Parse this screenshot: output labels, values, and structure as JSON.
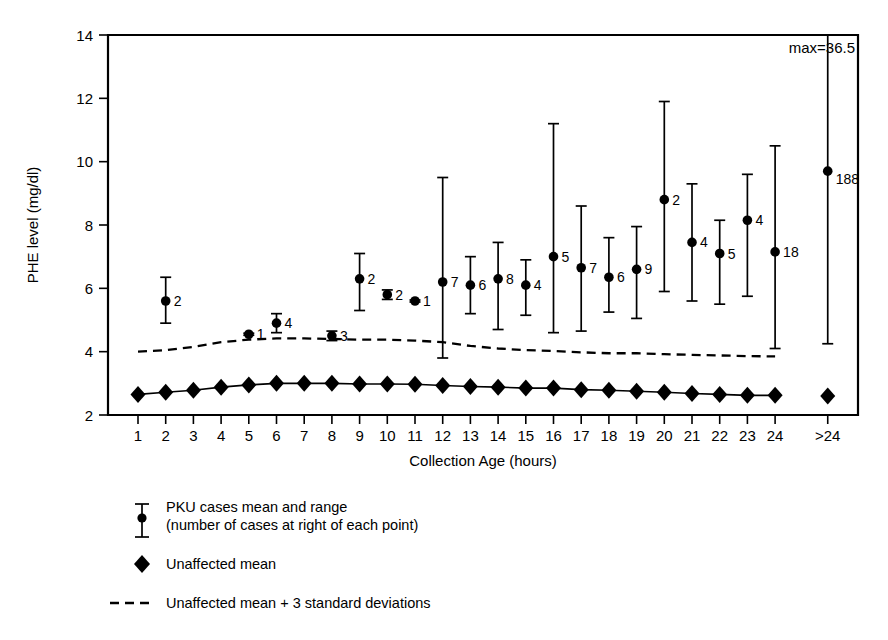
{
  "chart_data": {
    "type": "scatter",
    "title": "",
    "xlabel": "Collection Age (hours)",
    "ylabel": "PHE level (mg/dl)",
    "ylim": [
      2,
      14
    ],
    "yticks": [
      2,
      4,
      6,
      8,
      10,
      12,
      14
    ],
    "grid": false,
    "legend_position": "below-plot-left",
    "categories": [
      "1",
      "2",
      "3",
      "4",
      "5",
      "6",
      "7",
      "8",
      "9",
      "10",
      "11",
      "12",
      "13",
      "14",
      "15",
      "16",
      "17",
      "18",
      "19",
      "20",
      "21",
      "22",
      "23",
      "24",
      ">24"
    ],
    "annotations": [
      {
        "text": "max=36.5",
        "x_category": ">24",
        "note": "upper range of >24 group truncated at plot top"
      }
    ],
    "series": [
      {
        "name": "PKU cases mean and range",
        "type": "point_with_range",
        "marker": "filled-circle-with-error-bar",
        "points": [
          {
            "x": "1",
            "mean": null,
            "low": null,
            "high": null,
            "n": null
          },
          {
            "x": "2",
            "mean": 5.6,
            "low": 4.9,
            "high": 6.35,
            "n": 2
          },
          {
            "x": "3",
            "mean": null,
            "low": null,
            "high": null,
            "n": null
          },
          {
            "x": "4",
            "mean": null,
            "low": null,
            "high": null,
            "n": null
          },
          {
            "x": "5",
            "mean": 4.55,
            "low": 4.55,
            "high": 4.55,
            "n": 1
          },
          {
            "x": "6",
            "mean": 4.9,
            "low": 4.6,
            "high": 5.2,
            "n": 4
          },
          {
            "x": "7",
            "mean": null,
            "low": null,
            "high": null,
            "n": null
          },
          {
            "x": "8",
            "mean": 4.5,
            "low": 4.35,
            "high": 4.65,
            "n": 3
          },
          {
            "x": "9",
            "mean": 6.3,
            "low": 5.3,
            "high": 7.1,
            "n": 2
          },
          {
            "x": "10",
            "mean": 5.8,
            "low": 5.65,
            "high": 5.95,
            "n": 2
          },
          {
            "x": "11",
            "mean": 5.6,
            "low": 5.6,
            "high": 5.6,
            "n": 1
          },
          {
            "x": "12",
            "mean": 6.2,
            "low": 3.8,
            "high": 9.5,
            "n": 7
          },
          {
            "x": "13",
            "mean": 6.1,
            "low": 5.2,
            "high": 7.0,
            "n": 6
          },
          {
            "x": "14",
            "mean": 6.3,
            "low": 4.7,
            "high": 7.45,
            "n": 8
          },
          {
            "x": "15",
            "mean": 6.1,
            "low": 5.15,
            "high": 6.9,
            "n": 4
          },
          {
            "x": "16",
            "mean": 7.0,
            "low": 4.6,
            "high": 11.2,
            "n": 5
          },
          {
            "x": "17",
            "mean": 6.65,
            "low": 4.65,
            "high": 8.6,
            "n": 7
          },
          {
            "x": "18",
            "mean": 6.35,
            "low": 5.25,
            "high": 7.6,
            "n": 6
          },
          {
            "x": "19",
            "mean": 6.6,
            "low": 5.05,
            "high": 7.95,
            "n": 9
          },
          {
            "x": "20",
            "mean": 8.8,
            "low": 5.9,
            "high": 11.9,
            "n": 2
          },
          {
            "x": "21",
            "mean": 7.45,
            "low": 5.6,
            "high": 9.3,
            "n": 4
          },
          {
            "x": "22",
            "mean": 7.1,
            "low": 5.5,
            "high": 8.15,
            "n": 5
          },
          {
            "x": "23",
            "mean": 8.15,
            "low": 5.75,
            "high": 9.6,
            "n": 4
          },
          {
            "x": "24",
            "mean": 7.15,
            "low": 4.1,
            "high": 10.5,
            "n": 18
          },
          {
            "x": ">24",
            "mean": 9.7,
            "low": 4.25,
            "high": 14.0,
            "n": 188
          }
        ]
      },
      {
        "name": "Unaffected mean",
        "type": "line_with_markers",
        "marker": "filled-diamond",
        "values": [
          2.65,
          2.72,
          2.78,
          2.88,
          2.95,
          3.0,
          3.0,
          3.0,
          2.98,
          2.98,
          2.97,
          2.93,
          2.9,
          2.88,
          2.85,
          2.85,
          2.8,
          2.78,
          2.75,
          2.72,
          2.68,
          2.65,
          2.62,
          2.62,
          2.6
        ]
      },
      {
        "name": "Unaffected mean + 3 standard deviations",
        "type": "dashed_line",
        "values": [
          4.0,
          4.05,
          4.15,
          4.3,
          4.38,
          4.42,
          4.42,
          4.4,
          4.38,
          4.38,
          4.35,
          4.3,
          4.18,
          4.1,
          4.05,
          4.02,
          3.98,
          3.95,
          3.95,
          3.92,
          3.9,
          3.88,
          3.86,
          3.85,
          null
        ]
      }
    ]
  },
  "axes": {
    "y_title": "PHE level (mg/dl)",
    "x_title": "Collection Age (hours)",
    "y_tick_labels": [
      "14",
      "12",
      "10",
      "8",
      "6",
      "4",
      "2"
    ],
    "x_tick_labels": [
      "1",
      "2",
      "3",
      "4",
      "5",
      "6",
      "7",
      "8",
      "9",
      "10",
      "11",
      "12",
      "13",
      "14",
      "15",
      "16",
      "17",
      "18",
      "19",
      "20",
      "21",
      "22",
      "23",
      "24",
      ">24"
    ]
  },
  "annotation": {
    "max_label": "max=36.5"
  },
  "legend": {
    "items": [
      {
        "key": "pku",
        "marker": "error-bar-with-dot",
        "line1": "PKU cases mean and range",
        "line2": "(number of cases at right of each point)"
      },
      {
        "key": "unaffected",
        "marker": "filled-diamond",
        "line1": "Unaffected mean",
        "line2": ""
      },
      {
        "key": "sd3",
        "marker": "dashed-line",
        "line1": "Unaffected mean + 3 standard deviations",
        "line2": ""
      }
    ]
  },
  "colors": {
    "ink": "#000000",
    "background": "#ffffff"
  }
}
